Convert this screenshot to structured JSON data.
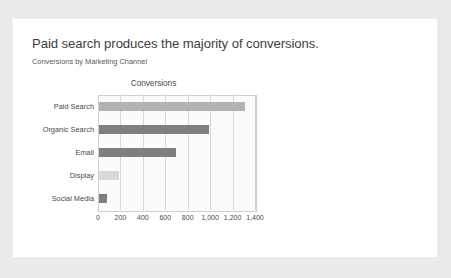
{
  "slide": {
    "title": "Paid search produces the majority of conversions.",
    "subtitle": "Conversions by Marketing Channel",
    "background_color": "#eceaea",
    "card_color": "#ffffff"
  },
  "chart_data": {
    "type": "bar",
    "orientation": "horizontal",
    "title": "Conversions",
    "xlabel": "",
    "ylabel": "",
    "categories": [
      "Paid Search",
      "Organic Search",
      "Email",
      "Display",
      "Social Media"
    ],
    "values": [
      1300,
      980,
      690,
      180,
      70
    ],
    "colors": [
      "#b3b3b3",
      "#7f7f7f",
      "#7f7f7f",
      "#d9d9d9",
      "#7f7f7f"
    ],
    "xlim": [
      0,
      1400
    ],
    "xticks": [
      0,
      200,
      400,
      600,
      800,
      1000,
      1200,
      1400
    ],
    "xtick_labels": [
      "0",
      "200",
      "400",
      "600",
      "800",
      "1,000",
      "1,200",
      "1,400"
    ],
    "grid": true,
    "grid_axis": "x",
    "legend": false,
    "plot_background": "#fbfbfb",
    "axis_color": "#cfcfcf"
  }
}
